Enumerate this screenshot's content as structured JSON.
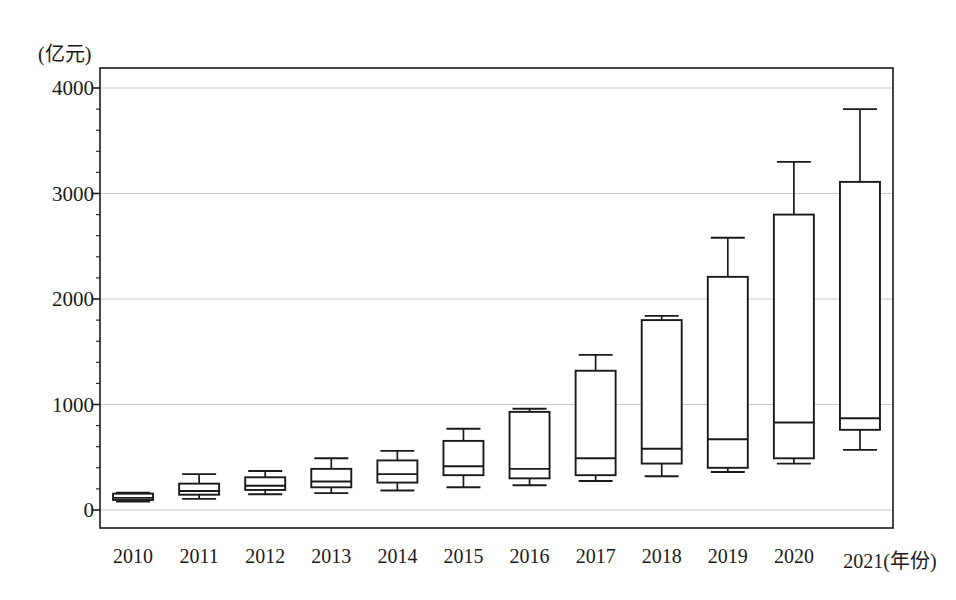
{
  "chart_data": {
    "type": "box",
    "title": "",
    "subtitle": "",
    "xlabel": "(年份)",
    "ylabel": "(亿元)",
    "ylim": [
      0,
      4000
    ],
    "yticks": [
      0,
      1000,
      2000,
      3000,
      4000
    ],
    "ytick_labels": [
      "0",
      "1000",
      "2000",
      "3000",
      "4000"
    ],
    "grid": "horizontal",
    "legend": "none",
    "categories": [
      "2010",
      "2011",
      "2012",
      "2013",
      "2014",
      "2015",
      "2016",
      "2017",
      "2018",
      "2019",
      "2020",
      "2021"
    ],
    "xtick_labels": [
      "2010",
      "2011",
      "2012",
      "2013",
      "2014",
      "2015",
      "2016",
      "2017",
      "2018",
      "2019",
      "2020",
      "2021(年份)"
    ],
    "boxes": [
      {
        "category": "2010",
        "min": 80,
        "q1": 95,
        "median": 115,
        "q3": 155,
        "max": 165
      },
      {
        "category": "2011",
        "min": 105,
        "q1": 145,
        "median": 180,
        "q3": 250,
        "max": 340
      },
      {
        "category": "2012",
        "min": 150,
        "q1": 190,
        "median": 230,
        "q3": 310,
        "max": 370
      },
      {
        "category": "2013",
        "min": 160,
        "q1": 215,
        "median": 270,
        "q3": 390,
        "max": 490
      },
      {
        "category": "2014",
        "min": 185,
        "q1": 260,
        "median": 340,
        "q3": 470,
        "max": 560
      },
      {
        "category": "2015",
        "min": 215,
        "q1": 330,
        "median": 415,
        "q3": 655,
        "max": 770
      },
      {
        "category": "2016",
        "min": 235,
        "q1": 300,
        "median": 390,
        "q3": 930,
        "max": 960
      },
      {
        "category": "2017",
        "min": 275,
        "q1": 330,
        "median": 490,
        "q3": 1320,
        "max": 1470
      },
      {
        "category": "2018",
        "min": 320,
        "q1": 440,
        "median": 580,
        "q3": 1800,
        "max": 1840
      },
      {
        "category": "2019",
        "min": 360,
        "q1": 400,
        "median": 670,
        "q3": 2210,
        "max": 2580
      },
      {
        "category": "2020",
        "min": 440,
        "q1": 490,
        "median": 830,
        "q3": 2800,
        "max": 3300
      },
      {
        "category": "2021",
        "min": 570,
        "q1": 760,
        "median": 870,
        "q3": 3110,
        "max": 3800
      }
    ],
    "colors": {
      "box_stroke": "#1a1a1a",
      "box_fill": "#ffffff",
      "grid": "#c9c9c9",
      "axis": "#1a1a1a",
      "text": "#1a1a1a"
    }
  }
}
